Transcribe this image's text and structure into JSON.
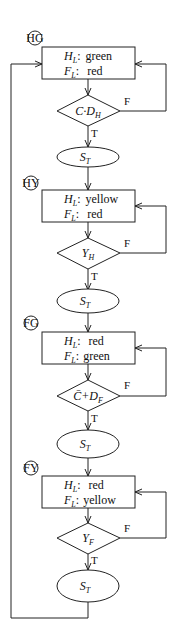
{
  "diagram": {
    "type": "flowchart",
    "states": [
      {
        "id": "HG",
        "tag": "HG",
        "highway_label": "H",
        "highway_sub": "L",
        "highway_value": "green",
        "farm_label": "F",
        "farm_sub": "L",
        "farm_value": "red",
        "condition": "C·D",
        "condition_sub": "H",
        "timer": "S",
        "timer_sub": "T"
      },
      {
        "id": "HY",
        "tag": "HY",
        "highway_label": "H",
        "highway_sub": "L",
        "highway_value": "yellow",
        "farm_label": "F",
        "farm_sub": "L",
        "farm_value": "red",
        "condition": "Y",
        "condition_sub": "H",
        "timer": "S",
        "timer_sub": "T"
      },
      {
        "id": "FG",
        "tag": "FG",
        "highway_label": "H",
        "highway_sub": "L",
        "highway_value": "red",
        "farm_label": "F",
        "farm_sub": "L",
        "farm_value": "green",
        "condition": "C̄+D",
        "condition_sub": "F",
        "timer": "S",
        "timer_sub": "T"
      },
      {
        "id": "FY",
        "tag": "FY",
        "highway_label": "H",
        "highway_sub": "L",
        "highway_value": "red",
        "farm_label": "F",
        "farm_sub": "L",
        "farm_value": "yellow",
        "condition": "Y",
        "condition_sub": "F",
        "timer": "S",
        "timer_sub": "T"
      }
    ],
    "branch_labels": {
      "true": "T",
      "false": "F"
    },
    "colon": ":"
  }
}
